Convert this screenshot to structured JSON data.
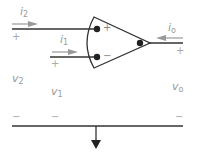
{
  "diagram": {
    "type": "op-amp circuit",
    "labels": {
      "i2": {
        "base": "i",
        "sub": "2"
      },
      "i1": {
        "base": "i",
        "sub": "1"
      },
      "io": {
        "base": "i",
        "sub": "o"
      },
      "v2": {
        "base": "v",
        "sub": "2"
      },
      "v1": {
        "base": "v",
        "sub": "1"
      },
      "vo": {
        "base": "v",
        "sub": "o"
      }
    },
    "terminal_signs": {
      "noninverting": "+",
      "inverting": "−",
      "v2_plus": "+",
      "v1_plus": "+",
      "vo_plus": "+",
      "v2_minus": "−",
      "v1_minus": "−",
      "vo_minus": "−"
    },
    "colors": {
      "wire": "#333333",
      "arrow": "#999999",
      "label": "#9a9a9a"
    }
  }
}
